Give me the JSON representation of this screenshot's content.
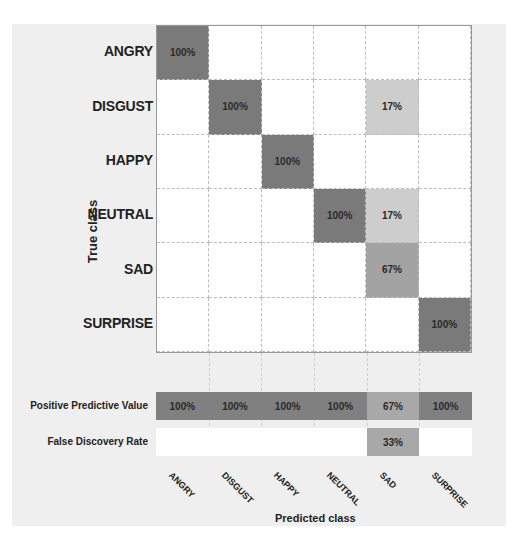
{
  "chart_data": {
    "type": "heatmap",
    "title": "",
    "xlabel": "Predicted class",
    "ylabel": "True class",
    "categories": [
      "ANGRY",
      "DISGUST",
      "HAPPY",
      "NEUTRAL",
      "SAD",
      "SURPRISE"
    ],
    "rows": [
      "ANGRY",
      "DISGUST",
      "HAPPY",
      "NEUTRAL",
      "SAD",
      "SURPRISE"
    ],
    "cells": [
      [
        "100%",
        "",
        "",
        "",
        "",
        ""
      ],
      [
        "",
        "100%",
        "",
        "",
        "17%",
        ""
      ],
      [
        "",
        "",
        "100%",
        "",
        "",
        ""
      ],
      [
        "",
        "",
        "",
        "100%",
        "17%",
        ""
      ],
      [
        "",
        "",
        "",
        "",
        "67%",
        ""
      ],
      [
        "",
        "",
        "",
        "",
        "",
        "100%"
      ]
    ],
    "values": [
      [
        100,
        0,
        0,
        0,
        0,
        0
      ],
      [
        0,
        100,
        0,
        0,
        17,
        0
      ],
      [
        0,
        0,
        100,
        0,
        0,
        0
      ],
      [
        0,
        0,
        0,
        100,
        17,
        0
      ],
      [
        0,
        0,
        0,
        0,
        67,
        0
      ],
      [
        0,
        0,
        0,
        0,
        0,
        100
      ]
    ],
    "summary_rows": [
      {
        "label": "Positive Predictive Value",
        "values": [
          "100%",
          "100%",
          "100%",
          "100%",
          "67%",
          "100%"
        ]
      },
      {
        "label": "False Discovery Rate",
        "values": [
          "",
          "",
          "",
          "",
          "33%",
          ""
        ]
      }
    ],
    "colors": {
      "high": "#7a7a7a",
      "mid": "#a3a3a3",
      "low": "#cdcdcd",
      "empty": "#ffffff"
    }
  }
}
